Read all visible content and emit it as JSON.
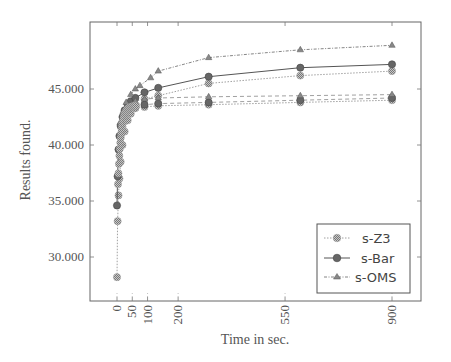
{
  "chart_data": {
    "type": "line",
    "title": "",
    "xlabel": "Time in sec.",
    "ylabel": "Results found.",
    "xticks": [
      0,
      50,
      100,
      200,
      550,
      900
    ],
    "yticks": [
      30000,
      35000,
      40000,
      45000
    ],
    "ytick_labels": [
      "30.000",
      "35.000",
      "40.000",
      "45.000"
    ],
    "xlim": [
      -90,
      990
    ],
    "ylim": [
      26000,
      50700
    ],
    "grid": false,
    "legend_position": "lower right",
    "series": [
      {
        "name": "s-Z3",
        "marker": "checker-circle",
        "line": "dotted",
        "x": [
          0,
          2,
          5,
          8,
          12,
          18,
          25,
          35,
          45,
          60,
          90,
          135,
          300,
          600,
          900
        ],
        "y": [
          28200,
          33200,
          35500,
          37000,
          38500,
          40000,
          41200,
          42200,
          42800,
          43300,
          44100,
          44400,
          45500,
          46200,
          46600
        ]
      },
      {
        "name": "s-Bar",
        "marker": "filled-circle",
        "line": "solid",
        "x": [
          0,
          2,
          5,
          8,
          12,
          18,
          25,
          35,
          45,
          60,
          90,
          135,
          300,
          600,
          900
        ],
        "y": [
          34600,
          37200,
          39600,
          40800,
          41700,
          42500,
          43100,
          43600,
          43900,
          44200,
          44700,
          45100,
          46100,
          46900,
          47200
        ]
      },
      {
        "name": "s-OMS",
        "marker": "triangle",
        "line": "dash-dotted",
        "x": [
          10,
          20,
          30,
          45,
          60,
          75,
          110,
          135,
          300,
          600,
          900
        ],
        "y": [
          42000,
          43000,
          43800,
          44500,
          45000,
          45300,
          46000,
          46600,
          47800,
          48500,
          48900
        ]
      },
      {
        "name": "s-Z3 (lower group)",
        "marker": "checker-circle",
        "line": "dotted",
        "x": [
          60,
          90,
          135,
          300,
          600,
          900
        ],
        "y": [
          43300,
          43400,
          43500,
          43600,
          43800,
          44000
        ]
      },
      {
        "name": "s-Bar (lower group)",
        "marker": "filled-circle",
        "line": "dashed",
        "x": [
          60,
          90,
          135,
          300,
          600,
          900
        ],
        "y": [
          43500,
          43600,
          43700,
          43800,
          44000,
          44200
        ]
      },
      {
        "name": "s-OMS (lower group)",
        "marker": "triangle",
        "line": "dashed",
        "x": [
          60,
          90,
          135,
          300,
          600,
          900
        ],
        "y": [
          43900,
          44100,
          44200,
          44300,
          44400,
          44500
        ]
      }
    ]
  },
  "legend": {
    "items": [
      {
        "label": "s-Z3"
      },
      {
        "label": "s-Bar"
      },
      {
        "label": "s-OMS"
      }
    ]
  },
  "axes": {
    "xlabel": "Time in sec.",
    "ylabel": "Results found."
  }
}
